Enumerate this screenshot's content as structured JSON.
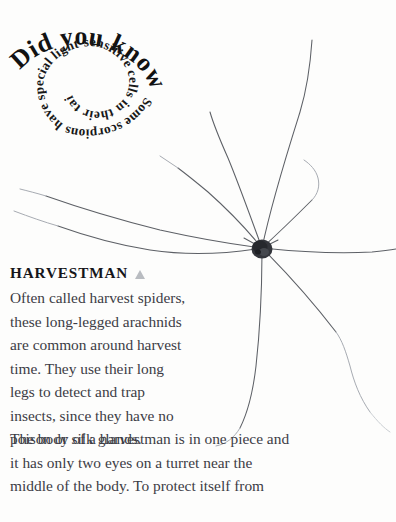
{
  "page": {
    "background_color": "#fdfdfc",
    "text_color": "#3c3c45",
    "marker_color": "#b9bcc1"
  },
  "did_you_know": {
    "headline": "Did you know?",
    "fact": "Some scorpions have special light-sensitive cells in their tails."
  },
  "illustration": {
    "caption_label": "harvestman-spider-photo",
    "body_color": "#2e3036",
    "leg_color": "#5d6066"
  },
  "article": {
    "heading": "HARVESTMAN",
    "marker_icon": "triangle-up-icon",
    "narrow_lines": [
      "Often called harvest spiders,",
      "these long-legged arachnids",
      "are common around harvest",
      "time. They use their long",
      "legs to detect and trap",
      "insects, since they have no",
      "poison or silk glands."
    ],
    "wide_lines": [
      "The body of a harvestman is in one piece and",
      "it has only two eyes on a turret near the",
      "middle of the body. To protect itself from"
    ]
  }
}
